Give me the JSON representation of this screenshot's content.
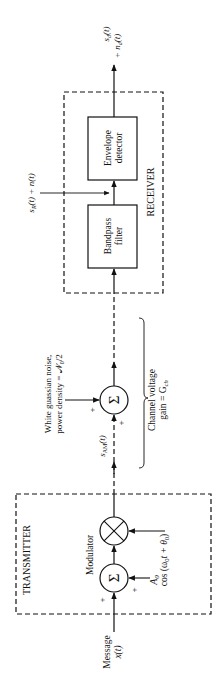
{
  "diagram": {
    "orientation": "rotated 90deg counter-clockwise (signal flows bottom to top)",
    "transmitter": {
      "title": "TRANSMITTER",
      "input_label_1": "Message",
      "input_label_2": "x(t)",
      "summer_symbol": "Σ",
      "summer_plus_input": "+",
      "summer_plus_carrier_dc": "+",
      "dc_label": "A",
      "dc_sub": "0",
      "modulator_label": "Modulator",
      "multiplier_symbol": "⊗",
      "carrier_label_pre": "cos (ω",
      "carrier_label_sub": "0",
      "carrier_label_mid": "t + θ",
      "carrier_label_sub2": "0",
      "carrier_label_post": ")"
    },
    "channel": {
      "tx_signal_label": "s",
      "tx_signal_sub": "AM",
      "tx_signal_arg": "(t)",
      "noise_label_1": "White guassian noise,",
      "noise_label_2": "power density = 𝒩",
      "noise_label_2_sub": "0",
      "noise_label_2_post": "/2",
      "summer_symbol": "Σ",
      "plus_signal": "+",
      "plus_noise": "+",
      "gain_label_1": "Channel voltage",
      "gain_label_2": "gain = G",
      "gain_label_2_sub": "ch"
    },
    "receiver": {
      "title": "RECEIVER",
      "bandpass_1": "Bandpass",
      "bandpass_2": "filter",
      "envelope_1": "Envelope",
      "envelope_2": "detector",
      "mid_signal_label": "s",
      "mid_signal_sub": "R",
      "mid_signal_post": "(t) + n(t)",
      "output_label_1_pre": "s",
      "output_label_1_sub": "d",
      "output_label_1_post": "(t)",
      "output_label_2_pre": "+ n",
      "output_label_2_sub": "d",
      "output_label_2_post": "(t)"
    },
    "colors": {
      "ink": "#111111",
      "background": "#ffffff"
    }
  }
}
